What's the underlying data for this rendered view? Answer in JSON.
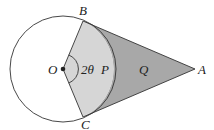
{
  "diagram": {
    "type": "geometry",
    "labels": {
      "center": "O",
      "top_point": "B",
      "bottom_point": "C",
      "external_point": "A",
      "angle": "2θ",
      "sector_region": "P",
      "outer_region": "Q"
    },
    "colors": {
      "sector_fill": "#d6d6d6",
      "outer_fill": "#a8a8a8",
      "stroke": "#333333",
      "background": "#ffffff"
    },
    "geometry": {
      "circle_center": [
        63,
        69
      ],
      "circle_radius": 53,
      "B": [
        83,
        21
      ],
      "C": [
        83,
        117
      ],
      "A": [
        195,
        69
      ]
    }
  }
}
